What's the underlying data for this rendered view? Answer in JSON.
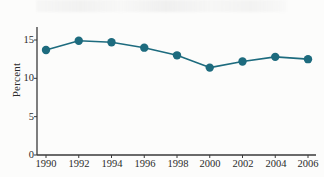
{
  "figure": {
    "name": "percent-line-chart",
    "background_color": "#fcfcfb",
    "ylabel": "Percent"
  },
  "chart_data": {
    "type": "line",
    "title": "",
    "subtitle": "",
    "xlabel": "",
    "ylabel": "Percent",
    "x": [
      1990,
      1992,
      1994,
      1996,
      1998,
      2000,
      2002,
      2004,
      2006
    ],
    "categories": [
      "1990",
      "1992",
      "1994",
      "1996",
      "1998",
      "2000",
      "2002",
      "2004",
      "2006"
    ],
    "values": [
      13.7,
      14.9,
      14.7,
      14.0,
      13.0,
      11.4,
      12.2,
      12.8,
      12.5
    ],
    "series": [
      {
        "name": "Percent",
        "values": [
          13.7,
          14.9,
          14.7,
          14.0,
          13.0,
          11.4,
          12.2,
          12.8,
          12.5
        ],
        "color": "#1d6b7e",
        "marker": "circle",
        "line_width": 1.6,
        "marker_size": 4.2
      }
    ],
    "xlim": [
      1990,
      2006
    ],
    "ylim": [
      0,
      16.2
    ],
    "yticks": [
      0,
      5,
      10,
      15
    ],
    "ytick_labels": [
      "0",
      "5",
      "10",
      "15"
    ],
    "xticks": [
      1990,
      1992,
      1994,
      1996,
      1998,
      2000,
      2002,
      2004,
      2006
    ],
    "xtick_labels": [
      "1990",
      "1992",
      "1994",
      "1996",
      "1998",
      "2000",
      "2002",
      "2004",
      "2006"
    ],
    "grid": false,
    "legend": null,
    "legend_position": "none",
    "annotations": [],
    "axis_color": "#3a3a3a",
    "accent_color": "#1d6b7e"
  },
  "axes": {
    "y_tick_0": "0",
    "y_tick_1": "5",
    "y_tick_2": "10",
    "y_tick_3": "15",
    "x_tick_0": "1990",
    "x_tick_1": "1992",
    "x_tick_2": "1994",
    "x_tick_3": "1996",
    "x_tick_4": "1998",
    "x_tick_5": "2000",
    "x_tick_6": "2002",
    "x_tick_7": "2004",
    "x_tick_8": "2006"
  }
}
